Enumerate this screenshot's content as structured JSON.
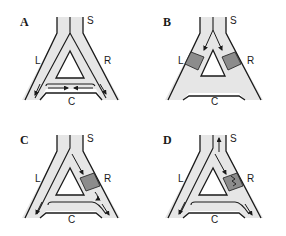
{
  "colors": {
    "background": "#ffffff",
    "channel_fill": "#e6e6e6",
    "outline": "#1a1a1a",
    "block_fill": "#8c8c8c",
    "arrow": "#1a1a1a"
  },
  "segment_labels": {
    "stem": "S",
    "left": "L",
    "right": "R",
    "connector": "C"
  },
  "panels": [
    {
      "id": "A",
      "label": "A",
      "blocks": [],
      "flow_description": "Flow enters S, splits into L and R, continues to bottom, and flows along C from both sides toward center"
    },
    {
      "id": "B",
      "label": "B",
      "blocks": [
        "L",
        "R"
      ],
      "flow_description": "Flow from S directed into L and R, both of which are blocked"
    },
    {
      "id": "C",
      "label": "C",
      "blocks": [
        "R"
      ],
      "flow_description": "R blocked; flow goes S to L, down to C, around to R below the block and out the bottom"
    },
    {
      "id": "D",
      "label": "D",
      "blocks": [
        "R-partial"
      ],
      "flow_description": "R partially blocked (zigzag); flow returns up S, around via L and C to lower R"
    }
  ]
}
